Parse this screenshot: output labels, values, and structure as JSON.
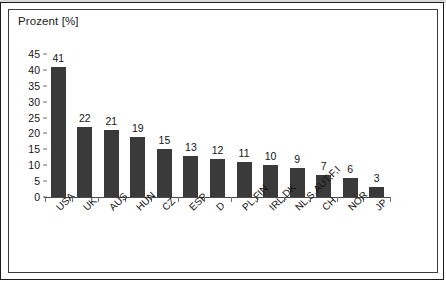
{
  "chart_data": {
    "type": "bar",
    "title": "Prozent [%]",
    "xlabel": "",
    "ylabel": "",
    "ylim": [
      0,
      45
    ],
    "ytick_step": 5,
    "grid": false,
    "legend": false,
    "bar_color": "#3a3a3a",
    "categories": [
      "USA",
      "UK",
      "AUS",
      "HUN",
      "CZ",
      "ESP",
      "D",
      "PL,FIN",
      "IRL,DK",
      "NL,S,AUT,F,I",
      "CH",
      "NOR",
      "JP"
    ],
    "values": [
      41,
      22,
      21,
      19,
      15,
      13,
      12,
      11,
      10,
      9,
      7,
      6,
      3
    ],
    "value_labels": [
      "41",
      "22",
      "21",
      "19",
      "15",
      "13",
      "12",
      "11",
      "10",
      "9",
      "7",
      "6",
      "3"
    ],
    "ytick_labels": [
      "0",
      "5",
      "10",
      "15",
      "20",
      "25",
      "30",
      "35",
      "40",
      "45"
    ],
    "ytick_values": [
      0,
      5,
      10,
      15,
      20,
      25,
      30,
      35,
      40,
      45
    ]
  }
}
